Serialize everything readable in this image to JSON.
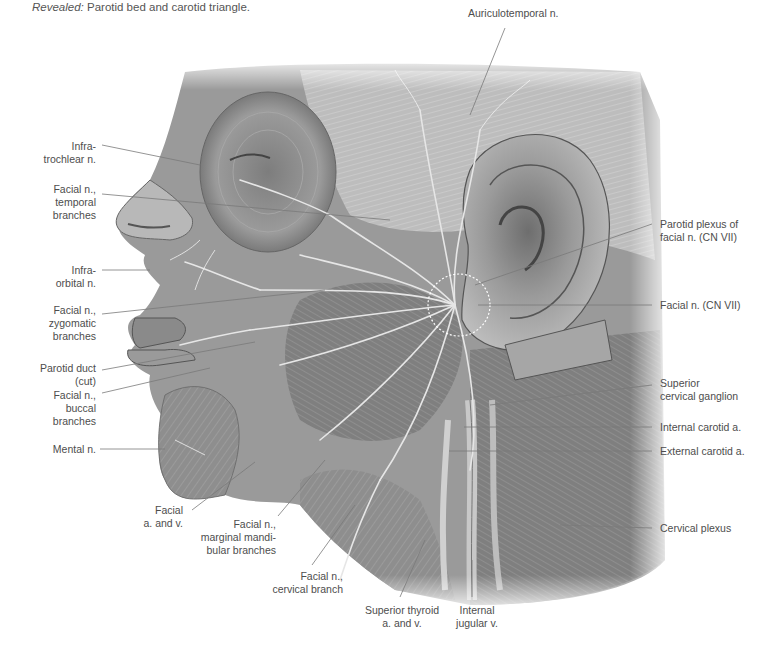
{
  "caption": {
    "prefix": "Revealed:",
    "text": " Parotid bed and carotid triangle."
  },
  "figure": {
    "colors": {
      "background": "#ffffff",
      "label_text": "#4d4d4d",
      "leader_line": "#7a7a7a",
      "illustration_tone": "#8c8c8c"
    }
  },
  "labels": {
    "auriculotemporal": "Auriculotemporal n.",
    "infratrochlear_1": "Infra-",
    "infratrochlear_2": "trochlear n.",
    "facial_temporal_1": "Facial n.,",
    "facial_temporal_2": "temporal",
    "facial_temporal_3": "branches",
    "infraorbital_1": "Infra-",
    "infraorbital_2": "orbital n.",
    "facial_zygomatic_1": "Facial n.,",
    "facial_zygomatic_2": "zygomatic",
    "facial_zygomatic_3": "branches",
    "parotid_duct_1": "Parotid duct",
    "parotid_duct_2": "(cut)",
    "facial_buccal_1": "Facial n.,",
    "facial_buccal_2": "buccal",
    "facial_buccal_3": "branches",
    "mental": "Mental n.",
    "facial_av_1": "Facial",
    "facial_av_2": "a. and v.",
    "facial_marginal_1": "Facial n.,",
    "facial_marginal_2": "marginal mandi-",
    "facial_marginal_3": "bular branches",
    "facial_cervical_1": "Facial n.,",
    "facial_cervical_2": "cervical branch",
    "sup_thyroid_1": "Superior  thyroid",
    "sup_thyroid_2": "a. and v.",
    "int_jugular_1": "Internal",
    "int_jugular_2": "jugular v.",
    "parotid_plexus_1": "Parotid plexus of",
    "parotid_plexus_2": "facial n. (CN VII)",
    "facial_cn7": "Facial n. (CN VII)",
    "sup_cerv_ganglion_1": "Superior",
    "sup_cerv_ganglion_2": "cervical ganglion",
    "int_carotid": "Internal carotid a.",
    "ext_carotid": "External carotid a.",
    "cervical_plexus": "Cervical plexus"
  }
}
